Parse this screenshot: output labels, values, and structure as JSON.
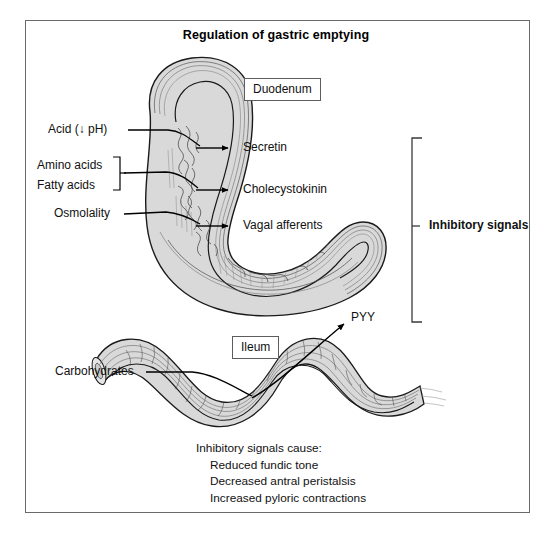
{
  "figure": {
    "title": "Regulation of gastric emptying",
    "border_color": "#6a6a6a",
    "organ_fill_color": "#d6d6d6",
    "organ_outline_color": "#1a1a1a"
  },
  "organ_labels": {
    "duodenum": "Duodenum",
    "ileum": "Ileum"
  },
  "stimuli": {
    "acid": "Acid (↓ pH)",
    "amino_acids": "Amino acids",
    "fatty_acids": "Fatty acids",
    "osmolality": "Osmolality",
    "carbohydrates": "Carbohydrates"
  },
  "mediators": {
    "secretin": "Secretin",
    "cholecystokinin": "Cholecystokinin",
    "vagal_afferents": "Vagal afferents",
    "pyy": "PYY"
  },
  "bracket_label": {
    "inhibitory_signals": "Inhibitory signals"
  },
  "caption": {
    "heading": "Inhibitory signals cause:",
    "effects": [
      "Reduced fundic tone",
      "Decreased antral peristalsis",
      "Increased pyloric contractions"
    ]
  }
}
